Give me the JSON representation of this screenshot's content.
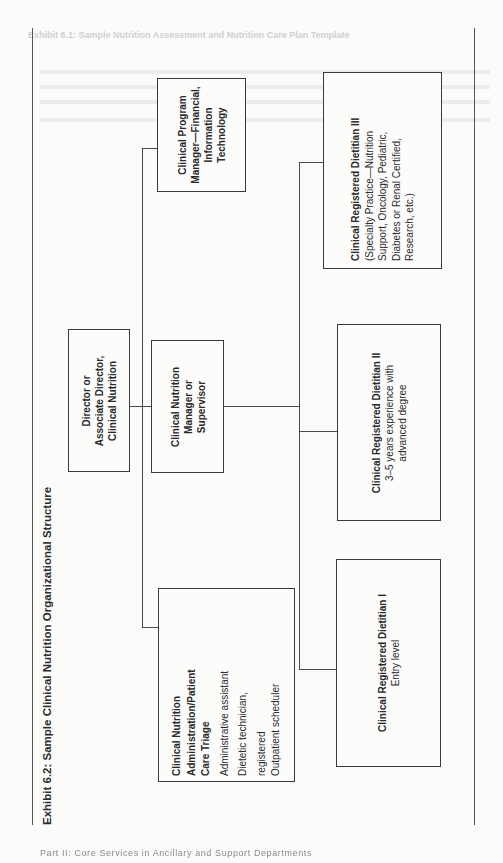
{
  "bleed_through": {
    "header_text": "Exhibit 6.1: Sample Nutrition Assessment and Nutrition Care Plan Template"
  },
  "exhibit": {
    "title": "Exhibit 6.2: Sample Clinical Nutrition Organizational Structure"
  },
  "org_chart": {
    "director": {
      "lines": [
        "Director or",
        "Associate Director,",
        "Clinical Nutrition"
      ]
    },
    "program_manager": {
      "lines": [
        "Clinical Program",
        "Manager—Financial,",
        "Information",
        "Technology"
      ]
    },
    "manager": {
      "lines": [
        "Clinical Nutrition",
        "Manager or",
        "Supervisor"
      ]
    },
    "administration": {
      "title_lines": [
        "Clinical Nutrition",
        "Administration/Patient",
        "Care Triage"
      ],
      "items": [
        "Administrative assistant",
        "Dietetic technician,",
        "registered",
        "Outpatient scheduler"
      ]
    },
    "rd_three": {
      "title": "Clinical Registered Dietitian III",
      "detail_lines": [
        "(Specialty Practice—Nutrition",
        "Support, Oncology, Pediatric,",
        "Diabetes or Renal Certified,",
        "Research, etc.)"
      ]
    },
    "rd_two": {
      "title": "Clinical Registered Dietitian II",
      "detail_lines": [
        "3–5 years experience with",
        "advanced degree"
      ]
    },
    "rd_one": {
      "title": "Clinical Registered Dietitian I",
      "detail_lines": [
        "Entry level"
      ]
    }
  },
  "footer": {
    "running_text": "Part II: Core Services in Ancillary and Support Departments"
  }
}
